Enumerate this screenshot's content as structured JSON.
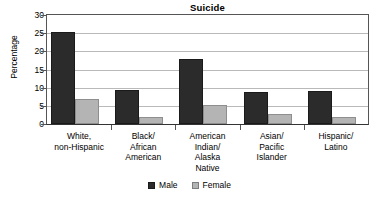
{
  "chart_data": {
    "type": "bar",
    "title": "Suicide",
    "xlabel": "",
    "ylabel": "Percentage",
    "ylim": [
      0,
      30
    ],
    "yticks": [
      0,
      5,
      10,
      15,
      20,
      25,
      30
    ],
    "grid": true,
    "legend_position": "bottom",
    "categories": [
      "White,\nnon-Hispanic",
      "Black/\nAfrican\nAmerican",
      "American\nIndian/\nAlaska\nNative",
      "Asian/\nPacific\nIslander",
      "Hispanic/\nLatino"
    ],
    "series": [
      {
        "name": "Male",
        "color": "#2b2b2b",
        "values": [
          25.3,
          9.3,
          18.0,
          8.8,
          9.0
        ]
      },
      {
        "name": "Female",
        "color": "#b4b4b4",
        "values": [
          7.0,
          2.0,
          5.3,
          2.8,
          2.0
        ]
      }
    ]
  }
}
